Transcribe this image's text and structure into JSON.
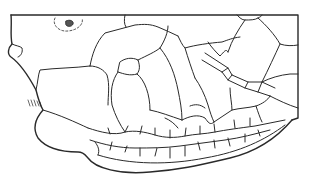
{
  "figure": {
    "stroke_color": "#2a2a2a",
    "background": "#ffffff"
  }
}
